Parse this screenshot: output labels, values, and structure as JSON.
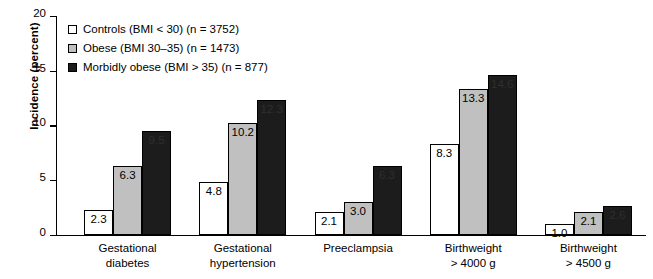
{
  "chart_data": {
    "type": "bar",
    "title": "",
    "subtitle": "",
    "xlabel": "",
    "ylabel": "Incidence (percent)",
    "ylim": [
      0,
      20
    ],
    "yticks": [
      "0",
      "5",
      "10",
      "15",
      "20"
    ],
    "grid": false,
    "legend_position": "upper-left-inside",
    "categories": [
      "Gestational\ndiabetes",
      "Gestational\nhypertension",
      "Preeclampsia",
      "Birthweight\n> 4000 g",
      "Birthweight\n> 4500 g"
    ],
    "category_lines": [
      [
        "Gestational",
        "diabetes"
      ],
      [
        "Gestational",
        "hypertension"
      ],
      [
        "Preeclampsia",
        ""
      ],
      [
        "Birthweight",
        "> 4000 g"
      ],
      [
        "Birthweight",
        "> 4500 g"
      ]
    ],
    "series": [
      {
        "name": "Controls (BMI < 30) (n = 3752)",
        "short_name": "Controls",
        "color": "#ffffff",
        "values": [
          2.3,
          4.8,
          2.1,
          8.3,
          1.0
        ],
        "labels": [
          "2.3",
          "4.8",
          "2.1",
          "8.3",
          "1.0"
        ]
      },
      {
        "name": "Obese (BMI 30–35) (n = 1473)",
        "short_name": "Obese",
        "color": "#c0c0c0",
        "values": [
          6.3,
          10.2,
          3.0,
          13.3,
          2.1
        ],
        "labels": [
          "6.3",
          "10.2",
          "3.0",
          "13.3",
          "2.1"
        ]
      },
      {
        "name": "Morbidly obese (BMI > 35) (n = 877)",
        "short_name": "Morbidly obese",
        "color": "#1c1c1c",
        "values": [
          9.5,
          12.3,
          6.3,
          14.6,
          2.6
        ],
        "labels": [
          "9.5",
          "12.3",
          "6.3",
          "14.6",
          "2.6"
        ]
      }
    ]
  },
  "axis": {
    "y_title": "Incidence (percent)",
    "y_tick_0": "0",
    "y_tick_1": "5",
    "y_tick_2": "10",
    "y_tick_3": "15",
    "y_tick_4": "20"
  },
  "legend": {
    "items": [
      {
        "label": "Controls (BMI < 30) (n = 3752)",
        "swatch": "#ffffff"
      },
      {
        "label": "Obese (BMI 30–35) (n = 1473)",
        "swatch": "#c0c0c0"
      },
      {
        "label": "Morbidly obese (BMI > 35) (n = 877)",
        "swatch": "#1c1c1c"
      }
    ]
  }
}
